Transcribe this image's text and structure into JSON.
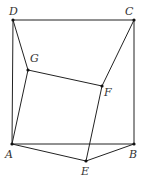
{
  "diagram": {
    "points": {
      "A": {
        "label": "A",
        "x": 12,
        "y": 144,
        "lx": 5,
        "ly": 158
      },
      "B": {
        "label": "B",
        "x": 134,
        "y": 144,
        "lx": 129,
        "ly": 158
      },
      "C": {
        "label": "C",
        "x": 134,
        "y": 20,
        "lx": 125,
        "ly": 15
      },
      "D": {
        "label": "D",
        "x": 13,
        "y": 20,
        "lx": 9,
        "ly": 15
      },
      "E": {
        "label": "E",
        "x": 86,
        "y": 161,
        "lx": 81,
        "ly": 175
      },
      "F": {
        "label": "F",
        "x": 102,
        "y": 86,
        "lx": 104,
        "ly": 96
      },
      "G": {
        "label": "G",
        "x": 28,
        "y": 70,
        "lx": 30,
        "ly": 62
      }
    },
    "segments": [
      [
        "D",
        "C"
      ],
      [
        "C",
        "B"
      ],
      [
        "B",
        "A"
      ],
      [
        "A",
        "D"
      ],
      [
        "D",
        "G"
      ],
      [
        "C",
        "F"
      ],
      [
        "G",
        "F"
      ],
      [
        "A",
        "G"
      ],
      [
        "F",
        "E"
      ],
      [
        "A",
        "E"
      ],
      [
        "E",
        "B"
      ]
    ],
    "line_color": "#222222"
  }
}
